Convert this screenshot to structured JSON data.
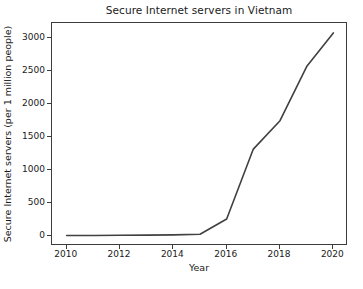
{
  "chart_data": {
    "type": "line",
    "title": "Secure Internet servers in Vietnam",
    "xlabel": "Year",
    "ylabel": "Secure Internet servers (per 1 million people)",
    "x": [
      2010,
      2011,
      2012,
      2013,
      2014,
      2015,
      2016,
      2017,
      2018,
      2019,
      2020
    ],
    "values": [
      10,
      12,
      15,
      17,
      20,
      30,
      260,
      1320,
      1750,
      2570,
      3080
    ],
    "series": [
      {
        "name": "Secure Internet servers",
        "values": [
          10,
          12,
          15,
          17,
          20,
          30,
          260,
          1320,
          1750,
          2570,
          3080
        ]
      }
    ],
    "xlim": [
      2009.45,
      2020.55
    ],
    "ylim": [
      -148,
      3230
    ],
    "xticks": [
      2010,
      2012,
      2014,
      2016,
      2018,
      2020
    ],
    "xtick_labels": [
      "2010",
      "2012",
      "2014",
      "2016",
      "2018",
      "2020"
    ],
    "yticks": [
      0,
      500,
      1000,
      1500,
      2000,
      2500,
      3000
    ],
    "ytick_labels": [
      "0",
      "500",
      "1000",
      "1500",
      "2000",
      "2500",
      "3000"
    ],
    "grid": false,
    "legend": false,
    "line_color": "#404040",
    "line_width": 1.6,
    "background_color": "#ffffff",
    "axes_color": "#3c3c3c"
  }
}
